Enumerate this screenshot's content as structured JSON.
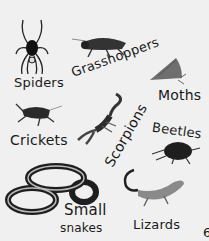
{
  "labels": {
    "spiders": "Spiders",
    "grasshoppers": "Grasshoppers",
    "moths": "Moths",
    "crickets": "Crickets",
    "scorpions": "Scorpions",
    "beetles": "Beetles",
    "small_snakes_line1": "Small",
    "small_snakes_line2": "snakes",
    "lizards": "Lizards",
    "page_edge_char": "6"
  },
  "icons": [
    "spider-icon",
    "grasshopper-icon",
    "moth-icon",
    "cricket-icon",
    "scorpion-icon",
    "beetle-icon",
    "snake-icon",
    "lizard-icon"
  ],
  "colors": {
    "background": "#f0f0f0",
    "ink": "#1a1a1a",
    "gray": "#777777"
  }
}
